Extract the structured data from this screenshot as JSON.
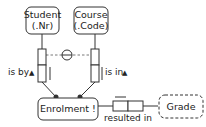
{
  "diagram": {
    "type": "ORM fact diagram",
    "colors": {
      "stroke": "#333333",
      "text": "#222222",
      "background": "#ffffff"
    },
    "entities": {
      "student": {
        "name": "Student",
        "refmode": "(.Nr)"
      },
      "course": {
        "name": "Course",
        "refmode": "(.Code)"
      },
      "enrolment": {
        "name": "Enrolment !"
      },
      "grade": {
        "name": "Grade"
      }
    },
    "roles": {
      "student_role": {
        "reading": "is by",
        "arrow": "▲"
      },
      "course_role": {
        "reading": "is in",
        "arrow": "▲"
      },
      "grade_role": {
        "reading": "resulted in"
      }
    },
    "constraints": {
      "external_uniqueness": "circle-bar"
    }
  }
}
